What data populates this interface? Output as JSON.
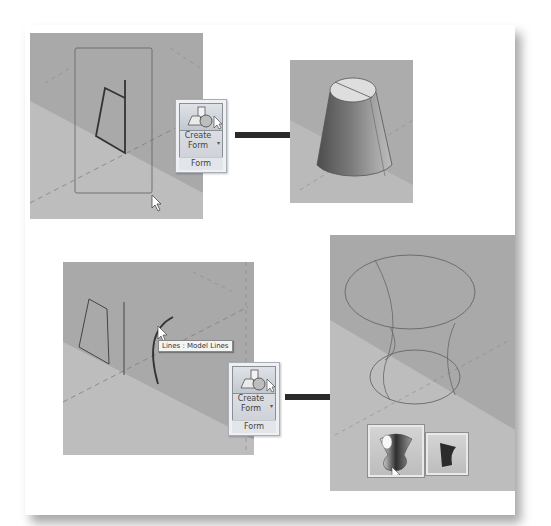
{
  "figure": {
    "colors": {
      "viewport_bg": "#b4b4b4",
      "viewport_plane_dark": "#a5a5a5",
      "ribbon_bg": "#eef0f3",
      "arrow": "#2a2a2a",
      "outline": "#555555"
    }
  },
  "step1": {
    "ribbon": {
      "button_label_line1": "Create",
      "button_label_line2": "Form",
      "panel_label": "Form",
      "icon": "create-form-icon"
    },
    "result": "solid-truncated-cone"
  },
  "step2": {
    "tooltip": "Lines : Model Lines",
    "ribbon": {
      "button_label_line1": "Create",
      "button_label_line2": "Form",
      "panel_label": "Form",
      "icon": "create-form-icon"
    },
    "result": "wireframe-hourglass",
    "form_options": [
      {
        "name": "solid-form-option",
        "selected": true
      },
      {
        "name": "surface-form-option",
        "selected": false
      }
    ]
  }
}
